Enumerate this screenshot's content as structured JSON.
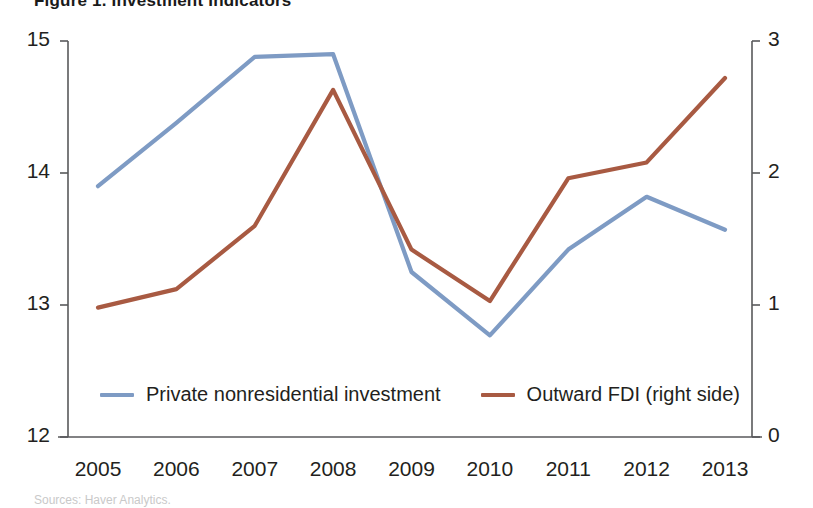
{
  "figure": {
    "cut_title": "Figure 1. Investment Indicators",
    "cut_footnote": "Sources: Haver Analytics."
  },
  "chart_data": {
    "type": "line",
    "title": "",
    "xlabel": "",
    "ylabel": "",
    "grid": false,
    "legend_position": "bottom",
    "categories": [
      "2005",
      "2006",
      "2007",
      "2008",
      "2009",
      "2010",
      "2011",
      "2012",
      "2013"
    ],
    "x_tick_labels": [
      "2005",
      "2006",
      "2007",
      "2008",
      "2009",
      "2010",
      "2011",
      "2012",
      "2013"
    ],
    "left_axis": {
      "ylim": [
        12,
        15
      ],
      "tick_labels": [
        "15",
        "14",
        "13",
        "12"
      ],
      "tick_values": [
        15,
        14,
        13,
        12
      ]
    },
    "right_axis": {
      "ylim": [
        0,
        3
      ],
      "tick_labels": [
        "3",
        "2",
        "1",
        "0"
      ],
      "tick_values": [
        3,
        2,
        1,
        0
      ]
    },
    "series": [
      {
        "name": "Private nonresidential investment",
        "axis": "left",
        "color": "#7e9bc4",
        "values": [
          13.9,
          14.38,
          14.88,
          14.9,
          13.25,
          12.77,
          13.42,
          13.82,
          13.57
        ]
      },
      {
        "name": "Outward FDI (right side)",
        "axis": "right",
        "color": "#a85a42",
        "values": [
          0.98,
          1.12,
          1.6,
          2.63,
          1.42,
          1.03,
          1.96,
          2.08,
          2.72
        ]
      }
    ]
  },
  "legend": [
    {
      "label": "Private nonresidential investment",
      "color": "#7e9bc4"
    },
    {
      "label": "Outward FDI (right side)",
      "color": "#a85a42"
    }
  ],
  "colors": {
    "blue_series": "#7e9bc4",
    "red_series": "#a85a42",
    "axis": "#58595b",
    "text": "#231f20"
  }
}
